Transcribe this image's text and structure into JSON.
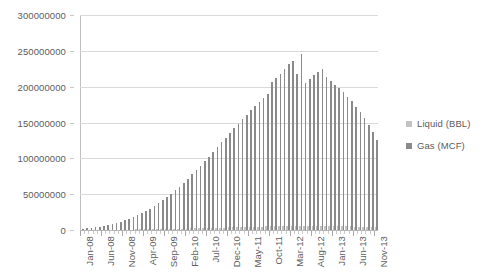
{
  "chart_data": {
    "type": "bar",
    "title": "",
    "subtitle": "",
    "xlabel": "",
    "ylabel": "",
    "ylim": [
      0,
      300000000
    ],
    "ytick_labels": [
      "0",
      "50000000",
      "100000000",
      "150000000",
      "200000000",
      "250000000",
      "300000000"
    ],
    "ytick_values": [
      0,
      50000000,
      100000000,
      150000000,
      200000000,
      250000000,
      300000000
    ],
    "grid": true,
    "legend_position": "right",
    "bar_layout": "grouped",
    "categories": [
      "Jan-08",
      "Feb-08",
      "Mar-08",
      "Apr-08",
      "May-08",
      "Jun-08",
      "Jul-08",
      "Aug-08",
      "Sep-08",
      "Oct-08",
      "Nov-08",
      "Dec-08",
      "Jan-09",
      "Feb-09",
      "Mar-09",
      "Apr-09",
      "May-09",
      "Jun-09",
      "Jul-09",
      "Aug-09",
      "Sep-09",
      "Oct-09",
      "Nov-09",
      "Dec-09",
      "Jan-10",
      "Feb-10",
      "Mar-10",
      "Apr-10",
      "May-10",
      "Jun-10",
      "Jul-10",
      "Aug-10",
      "Sep-10",
      "Oct-10",
      "Nov-10",
      "Dec-10",
      "Jan-11",
      "Feb-11",
      "Mar-11",
      "Apr-11",
      "May-11",
      "Jun-11",
      "Jul-11",
      "Aug-11",
      "Sep-11",
      "Oct-11",
      "Nov-11",
      "Dec-11",
      "Jan-12",
      "Feb-12",
      "Mar-12",
      "Apr-12",
      "May-12",
      "Jun-12",
      "Jul-12",
      "Aug-12",
      "Sep-12",
      "Oct-12",
      "Nov-12",
      "Dec-12",
      "Jan-13",
      "Feb-13",
      "Mar-13",
      "Apr-13",
      "May-13",
      "Jun-13",
      "Jul-13",
      "Aug-13",
      "Sep-13",
      "Oct-13",
      "Nov-13"
    ],
    "axis_tick_labels": [
      "Jan-08",
      "Jun-08",
      "Nov-08",
      "Apr-09",
      "Sep-09",
      "Feb-10",
      "Jul-10",
      "Dec-10",
      "May-11",
      "Oct-11",
      "Mar-12",
      "Aug-12",
      "Jan-13",
      "Jun-13",
      "Nov-13"
    ],
    "axis_tick_interval_months": 5,
    "series": [
      {
        "name": "Liquid (BBL)",
        "color": "#c3c3c3",
        "values": [
          120000,
          150000,
          180000,
          200000,
          240000,
          280000,
          330000,
          380000,
          430000,
          500000,
          560000,
          620000,
          700000,
          780000,
          860000,
          950000,
          1050000,
          1150000,
          1250000,
          1350000,
          1450000,
          1560000,
          1680000,
          1800000,
          1950000,
          2100000,
          2250000,
          2400000,
          2550000,
          2700000,
          2850000,
          3000000,
          3150000,
          3300000,
          3450000,
          3600000,
          3800000,
          3950000,
          4100000,
          4250000,
          4400000,
          4550000,
          4700000,
          4850000,
          5000000,
          5150000,
          5250000,
          5350000,
          5450000,
          5550000,
          5650000,
          5700000,
          5750000,
          5800000,
          5820000,
          5840000,
          5820000,
          5780000,
          5720000,
          5650000,
          5560000,
          5450000,
          5330000,
          5200000,
          5060000,
          4900000,
          4740000,
          4560000,
          4380000,
          4190000,
          4000000
        ]
      },
      {
        "name": "Gas (MCF)",
        "color": "#8a8a8a",
        "values": [
          1500000,
          2200000,
          3000000,
          3800000,
          4800000,
          5800000,
          7000000,
          8300000,
          9800000,
          11500000,
          13500000,
          15500000,
          18000000,
          20500000,
          23500000,
          26500000,
          30000000,
          33500000,
          37500000,
          41500000,
          46000000,
          50500000,
          55500000,
          60500000,
          66000000,
          71500000,
          77500000,
          83500000,
          89500000,
          96000000,
          102500000,
          109000000,
          115500000,
          122500000,
          129000000,
          135500000,
          142000000,
          148500000,
          155000000,
          161000000,
          167500000,
          173500000,
          179000000,
          184500000,
          190000000,
          206000000,
          212000000,
          217000000,
          225000000,
          231000000,
          236000000,
          218000000,
          245000000,
          205000000,
          211000000,
          216000000,
          221000000,
          225000000,
          214000000,
          208000000,
          203000000,
          198000000,
          192000000,
          186000000,
          180000000,
          172000000,
          164000000,
          156000000,
          147000000,
          137000000,
          125000000
        ]
      }
    ]
  },
  "legend": {
    "items": [
      {
        "label": "Liquid (BBL)",
        "color": "#c3c3c3"
      },
      {
        "label": "Gas (MCF)",
        "color": "#8a8a8a"
      }
    ]
  }
}
